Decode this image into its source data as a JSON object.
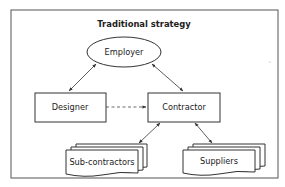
{
  "diagram": {
    "title": "Traditional strategy",
    "nodes": {
      "employer": {
        "label": "Employer",
        "shape": "ellipse"
      },
      "designer": {
        "label": "Designer",
        "shape": "rectangle"
      },
      "contractor": {
        "label": "Contractor",
        "shape": "rectangle"
      },
      "subcontractors": {
        "label": "Sub-contractors",
        "shape": "multi-document"
      },
      "suppliers": {
        "label": "Suppliers",
        "shape": "multi-document"
      }
    },
    "edges": [
      {
        "from": "employer",
        "to": "designer",
        "style": "solid",
        "direction": "both"
      },
      {
        "from": "employer",
        "to": "contractor",
        "style": "solid",
        "direction": "both"
      },
      {
        "from": "designer",
        "to": "contractor",
        "style": "dashed",
        "direction": "forward"
      },
      {
        "from": "contractor",
        "to": "subcontractors",
        "style": "solid",
        "direction": "both"
      },
      {
        "from": "contractor",
        "to": "suppliers",
        "style": "solid",
        "direction": "both"
      }
    ]
  }
}
